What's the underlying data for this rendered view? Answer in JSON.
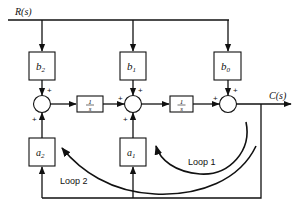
{
  "diagram": {
    "type": "block-diagram",
    "input_label": "R(s)",
    "output_label": "C(s)",
    "feedforward_gains": [
      {
        "id": "b2",
        "label": "b",
        "sub": "2"
      },
      {
        "id": "b1",
        "label": "b",
        "sub": "1"
      },
      {
        "id": "b0",
        "label": "b",
        "sub": "0"
      }
    ],
    "feedback_gains": [
      {
        "id": "a2",
        "label": "a",
        "sub": "2"
      },
      {
        "id": "a1",
        "label": "a",
        "sub": "1"
      }
    ],
    "integrators": [
      {
        "id": "int1",
        "num": "1",
        "den": "s"
      },
      {
        "id": "int2",
        "num": "1",
        "den": "s"
      }
    ],
    "summing_junctions": [
      {
        "id": "sum1",
        "signs": [
          "+",
          "+"
        ]
      },
      {
        "id": "sum2",
        "signs": [
          "+",
          "+",
          "+"
        ]
      },
      {
        "id": "sum3",
        "signs": [
          "+",
          "+"
        ]
      }
    ],
    "loops": [
      {
        "id": "loop1",
        "label": "Loop 1"
      },
      {
        "id": "loop2",
        "label": "Loop 2"
      }
    ],
    "plus_sign": "+"
  }
}
